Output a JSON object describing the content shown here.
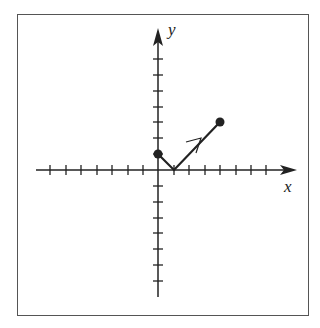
{
  "figure": {
    "axes": {
      "x_label": "x",
      "y_label": "y",
      "x_ticks": [
        -7,
        -6,
        -5,
        -4,
        -3,
        -2,
        -1,
        1,
        2,
        3,
        4,
        5,
        6,
        7
      ],
      "y_ticks_pos": [
        1,
        2,
        3,
        4,
        5,
        6,
        7
      ],
      "y_ticks_neg": [
        -1,
        -2,
        -3,
        -4,
        -5,
        -6,
        -7
      ],
      "tick_labels_shown": false
    },
    "path": {
      "points": [
        [
          0,
          1
        ],
        [
          1,
          0
        ],
        [
          4,
          3
        ]
      ],
      "start_point": [
        0,
        1
      ],
      "end_point": [
        4,
        3
      ],
      "direction_arrow_on_segment": "from (1,0) to (4,3)",
      "endpoint_style": "filled-dot"
    },
    "colors": {
      "stroke": "#222222",
      "frame": "#555555",
      "background": "#ffffff"
    }
  }
}
